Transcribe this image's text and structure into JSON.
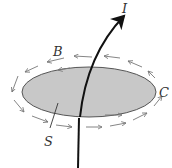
{
  "diagram": {
    "labels": {
      "current": "I",
      "field": "B",
      "curve": "C",
      "surface": "S"
    },
    "colors": {
      "surface_fill": "#c8c8c8",
      "surface_stroke": "#555555",
      "wire": "#111111",
      "field_arrows": "#777777",
      "label": "#333333"
    }
  }
}
